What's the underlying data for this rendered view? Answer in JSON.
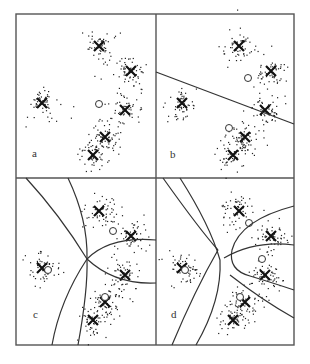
{
  "figure": {
    "panels": [
      {
        "id": "a",
        "label": "a",
        "boundaries": 0,
        "prototypes": 1
      },
      {
        "id": "b",
        "label": "b",
        "boundaries": 1,
        "prototypes": 2
      },
      {
        "id": "c",
        "label": "c",
        "boundaries": 3,
        "prototypes": 3
      },
      {
        "id": "d",
        "label": "d",
        "boundaries": 4,
        "prototypes": 4
      }
    ],
    "colors": {
      "frame": "#555555",
      "points": "#222222",
      "marks": "#111111",
      "curves": "#333333"
    }
  }
}
